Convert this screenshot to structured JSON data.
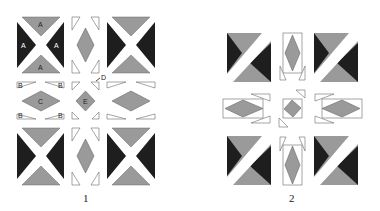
{
  "colors": {
    "dark": "#1e1e1e",
    "gray": "#9a9a9a",
    "outline": "#6a6a6a",
    "white": "#ffffff"
  },
  "figures": [
    {
      "caption": "1",
      "labels": {
        "A": "A",
        "B": "B",
        "C": "C",
        "D": "D",
        "E": "E"
      }
    },
    {
      "caption": "2"
    }
  ]
}
